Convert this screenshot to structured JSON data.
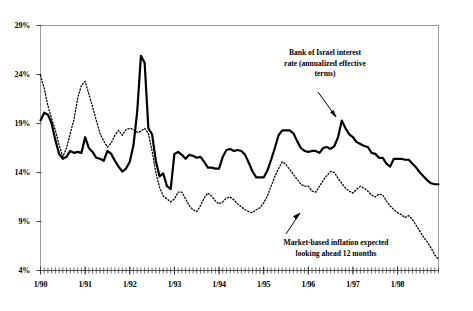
{
  "chart_data": {
    "type": "line",
    "title": "",
    "subtitle": "",
    "xlabel": "",
    "ylabel": "",
    "grid": false,
    "legend_position": "inline-annotations",
    "ylim": [
      4,
      29
    ],
    "ytick_labels": [
      "29%",
      "24%",
      "19%",
      "14%",
      "9%",
      "4%"
    ],
    "ytick_values": [
      29,
      24,
      19,
      14,
      9,
      4
    ],
    "xtick_labels": [
      "1/90",
      "1/91",
      "1/92",
      "1/93",
      "1/94",
      "1/95",
      "1/96",
      "1/97",
      "1/98"
    ],
    "xlim": [
      "1/90",
      "12/98"
    ],
    "x_minor_tick_interval_months": 1,
    "annotations": [
      {
        "id": "series1",
        "text": "Bank of Israel interest rate (annualized effective terms)",
        "lines": [
          "Bank of Israel interest",
          "rate (annualized effective",
          "terms)"
        ],
        "points_to": "solid-line-1996-peak"
      },
      {
        "id": "series2",
        "text": "Market-based inflation expected looking ahead 12 months",
        "lines": [
          "Market-based inflation expected",
          "looking ahead 12 months"
        ],
        "points_to": "dotted-line-1995-trough"
      }
    ],
    "series": [
      {
        "name": "Bank of Israel interest rate (annualized effective terms)",
        "style": "solid",
        "color": "#000000",
        "width": 2.2,
        "values": [
          19.3,
          20.1,
          19.9,
          19.0,
          17.3,
          15.9,
          15.4,
          15.6,
          16.2,
          16.0,
          16.1,
          16.0,
          17.6,
          16.5,
          16.1,
          15.5,
          15.4,
          15.2,
          16.2,
          15.9,
          15.2,
          14.6,
          14.1,
          14.4,
          15.1,
          16.8,
          20.2,
          25.9,
          25.2,
          18.5,
          17.9,
          15.2,
          13.6,
          13.9,
          12.6,
          12.3,
          15.9,
          16.1,
          15.8,
          15.4,
          15.8,
          15.7,
          15.5,
          15.6,
          15.1,
          14.5,
          14.5,
          14.4,
          14.4,
          15.6,
          16.3,
          16.4,
          16.2,
          16.3,
          16.2,
          15.8,
          15.0,
          14.1,
          13.5,
          13.5,
          13.5,
          14.2,
          15.3,
          16.5,
          17.8,
          18.3,
          18.3,
          18.3,
          18.0,
          17.2,
          16.5,
          16.2,
          16.1,
          16.2,
          16.2,
          16.0,
          16.5,
          16.6,
          16.4,
          16.7,
          17.6,
          19.3,
          18.5,
          17.9,
          17.6,
          17.1,
          16.9,
          16.7,
          16.6,
          16.0,
          15.9,
          15.5,
          15.5,
          14.9,
          14.6,
          15.4,
          15.4,
          15.4,
          15.3,
          15.3,
          14.9,
          14.5,
          14.0,
          13.6,
          13.2,
          12.9,
          12.8,
          12.8
        ]
      },
      {
        "name": "Market-based inflation expected looking ahead 12 months",
        "style": "dotted",
        "color": "#000000",
        "width": 1.3,
        "values": [
          23.9,
          22.6,
          20.8,
          19.5,
          18.3,
          16.8,
          15.6,
          16.5,
          18.0,
          19.4,
          21.6,
          22.9,
          23.3,
          22.0,
          20.7,
          19.3,
          18.0,
          17.2,
          16.6,
          17.0,
          17.8,
          18.3,
          17.8,
          18.4,
          18.5,
          18.4,
          18.1,
          18.2,
          18.5,
          18.0,
          16.2,
          14.0,
          12.5,
          11.6,
          11.3,
          11.0,
          11.3,
          12.0,
          12.0,
          11.3,
          10.6,
          10.2,
          10.0,
          10.6,
          11.4,
          11.9,
          11.6,
          11.1,
          10.8,
          11.0,
          11.4,
          11.5,
          11.2,
          10.8,
          10.5,
          10.2,
          10.0,
          9.9,
          10.2,
          10.4,
          10.9,
          11.6,
          12.6,
          13.6,
          14.4,
          15.1,
          14.8,
          14.3,
          13.8,
          13.3,
          12.8,
          12.6,
          12.6,
          12.1,
          12.0,
          12.6,
          13.2,
          13.7,
          14.1,
          14.0,
          13.4,
          12.9,
          12.4,
          12.1,
          11.9,
          12.3,
          12.6,
          12.4,
          12.1,
          11.7,
          11.5,
          11.8,
          11.7,
          11.1,
          10.6,
          10.2,
          9.9,
          9.7,
          9.4,
          9.6,
          9.2,
          8.6,
          8.0,
          7.4,
          6.9,
          6.3,
          5.6,
          5.1
        ]
      }
    ]
  }
}
